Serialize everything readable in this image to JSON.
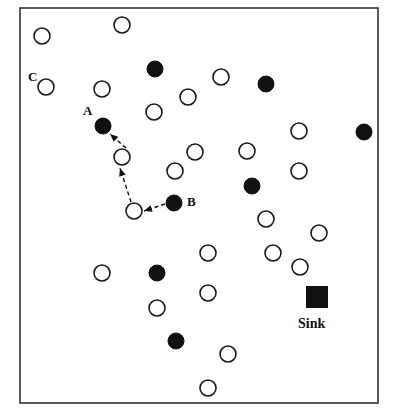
{
  "figure": {
    "background_color": "#ffffff",
    "frame": {
      "name": "field-boundary",
      "x": 20,
      "y": 8,
      "width": 358,
      "height": 395,
      "stroke_color": "#333333",
      "stroke_width": 1.6
    },
    "legend_note": "Filled circles = active/selected nodes, open circles = idle nodes, filled square = Sink"
  },
  "labels": [
    {
      "name": "node-label-a",
      "text": "A",
      "x": 83,
      "y": 115
    },
    {
      "name": "node-label-b",
      "text": "B",
      "x": 187,
      "y": 206
    },
    {
      "name": "node-label-c",
      "text": "C",
      "x": 28,
      "y": 81
    },
    {
      "name": "sink-label",
      "text": "Sink",
      "x": 298,
      "y": 328
    }
  ],
  "sink": {
    "name": "sink-node",
    "x": 306,
    "y": 286,
    "size": 22,
    "fill_color": "#111111"
  },
  "nodes_filled": [
    {
      "x": 155,
      "y": 69,
      "r": 8
    },
    {
      "x": 266,
      "y": 84,
      "r": 8
    },
    {
      "x": 103,
      "y": 126,
      "r": 8
    },
    {
      "x": 364,
      "y": 132,
      "r": 8
    },
    {
      "x": 252,
      "y": 186,
      "r": 8
    },
    {
      "x": 174,
      "y": 203,
      "r": 8
    },
    {
      "x": 157,
      "y": 273,
      "r": 8
    },
    {
      "x": 176,
      "y": 341,
      "r": 8
    }
  ],
  "nodes_open": [
    {
      "x": 122,
      "y": 25,
      "r": 8
    },
    {
      "x": 42,
      "y": 36,
      "r": 8
    },
    {
      "x": 221,
      "y": 77,
      "r": 8
    },
    {
      "x": 46,
      "y": 87,
      "r": 8
    },
    {
      "x": 102,
      "y": 89,
      "r": 8
    },
    {
      "x": 188,
      "y": 97,
      "r": 8
    },
    {
      "x": 154,
      "y": 112,
      "r": 8
    },
    {
      "x": 299,
      "y": 131,
      "r": 8
    },
    {
      "x": 195,
      "y": 152,
      "r": 8
    },
    {
      "x": 247,
      "y": 151,
      "r": 8
    },
    {
      "x": 122,
      "y": 157,
      "r": 8
    },
    {
      "x": 175,
      "y": 171,
      "r": 8
    },
    {
      "x": 299,
      "y": 171,
      "r": 8
    },
    {
      "x": 134,
      "y": 211,
      "r": 8
    },
    {
      "x": 266,
      "y": 219,
      "r": 8
    },
    {
      "x": 319,
      "y": 233,
      "r": 8
    },
    {
      "x": 208,
      "y": 253,
      "r": 8
    },
    {
      "x": 273,
      "y": 253,
      "r": 8
    },
    {
      "x": 300,
      "y": 267,
      "r": 8
    },
    {
      "x": 102,
      "y": 273,
      "r": 8
    },
    {
      "x": 208,
      "y": 293,
      "r": 8
    },
    {
      "x": 157,
      "y": 308,
      "r": 8
    },
    {
      "x": 228,
      "y": 354,
      "r": 8
    },
    {
      "x": 208,
      "y": 388,
      "r": 8
    }
  ],
  "route": {
    "name": "dashed-route-path",
    "stroke_color": "#111111",
    "stroke_width": 1.4,
    "dash_pattern": "4,3",
    "segments": [
      {
        "name": "segment-b-to-relay",
        "x1": 165,
        "y1": 204,
        "x2": 144,
        "y2": 211
      },
      {
        "name": "segment-relay-to-mid",
        "x1": 131,
        "y1": 202,
        "x2": 120,
        "y2": 168
      },
      {
        "name": "segment-mid-to-a",
        "x1": 126,
        "y1": 148,
        "x2": 110,
        "y2": 134
      }
    ]
  }
}
